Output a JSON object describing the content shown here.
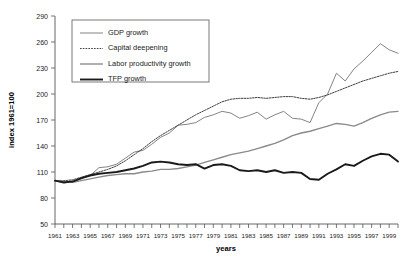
{
  "chart_data": {
    "type": "line",
    "title": "",
    "xlabel": "years",
    "ylabel": "index 1961=100",
    "xlim": [
      1961,
      2000
    ],
    "ylim": [
      50,
      290
    ],
    "ytick_values": [
      50,
      80,
      110,
      140,
      170,
      200,
      230,
      260,
      290
    ],
    "ytick_labels": [
      "50",
      "80",
      "110",
      "140",
      "170",
      "200",
      "230",
      "260",
      "290"
    ],
    "xtick_labels": [
      "1961",
      "1963",
      "1965",
      "1967",
      "1969",
      "1971",
      "1973",
      "1975",
      "1977",
      "1979",
      "1981",
      "1983",
      "1985",
      "1987",
      "1989",
      "1991",
      "1993",
      "1995",
      "1997",
      "1999"
    ],
    "grid": false,
    "legend_position": "upper-left",
    "x": [
      1961,
      1962,
      1963,
      1964,
      1965,
      1966,
      1967,
      1968,
      1969,
      1970,
      1971,
      1972,
      1973,
      1974,
      1975,
      1976,
      1977,
      1978,
      1979,
      1980,
      1981,
      1982,
      1983,
      1984,
      1985,
      1986,
      1987,
      1988,
      1989,
      1990,
      1991,
      1992,
      1993,
      1994,
      1995,
      1996,
      1997,
      1998,
      1999,
      2000
    ],
    "series": [
      {
        "name": "GDP growth",
        "style": "solid-thin",
        "color": "#6e6e6e",
        "values": [
          100,
          97,
          99,
          102,
          106,
          115,
          116,
          119,
          126,
          133,
          135,
          142,
          150,
          155,
          164,
          165,
          167,
          173,
          176,
          180,
          178,
          172,
          175,
          179,
          171,
          176,
          180,
          172,
          171,
          167,
          190,
          200,
          224,
          215,
          229,
          238,
          248,
          258,
          251,
          247
        ]
      },
      {
        "name": "Capital deepening",
        "style": "dotted",
        "color": "#2a2a2a",
        "values": [
          100,
          100,
          101,
          104,
          107,
          110,
          113,
          117,
          123,
          130,
          137,
          145,
          152,
          158,
          164,
          170,
          176,
          181,
          186,
          191,
          194,
          195,
          195,
          196,
          195,
          196,
          197,
          197,
          195,
          194,
          196,
          199,
          203,
          207,
          211,
          215,
          218,
          221,
          224,
          226
        ]
      },
      {
        "name": "Labor productivity growth",
        "style": "solid-medium",
        "color": "#8a8a8a",
        "values": [
          100,
          99,
          98,
          100,
          102,
          104,
          106,
          107,
          108,
          108,
          110,
          111,
          113,
          113,
          114,
          116,
          118,
          121,
          124,
          127,
          130,
          132,
          134,
          137,
          140,
          143,
          147,
          152,
          155,
          157,
          160,
          163,
          166,
          165,
          163,
          167,
          172,
          176,
          179,
          180
        ]
      },
      {
        "name": "TFP growth",
        "style": "solid-thick",
        "color": "#1a1a1a",
        "values": [
          100,
          98,
          99,
          103,
          106,
          108,
          109,
          110,
          112,
          114,
          117,
          121,
          122,
          121,
          119,
          118,
          119,
          114,
          118,
          119,
          117,
          112,
          111,
          112,
          110,
          112,
          109,
          110,
          109,
          102,
          101,
          108,
          113,
          119,
          117,
          123,
          128,
          131,
          130,
          122
        ]
      }
    ]
  },
  "legend": {
    "entries": [
      {
        "label": "GDP growth",
        "key": "gdp-growth"
      },
      {
        "label": "Capital deepening",
        "key": "capital-deepening"
      },
      {
        "label": "Labor productivity growth",
        "key": "labor-productivity-growth"
      },
      {
        "label": "TFP growth",
        "key": "tfp-growth"
      }
    ]
  },
  "axes": {
    "y_title": "index 1961=100",
    "x_title": "years"
  }
}
